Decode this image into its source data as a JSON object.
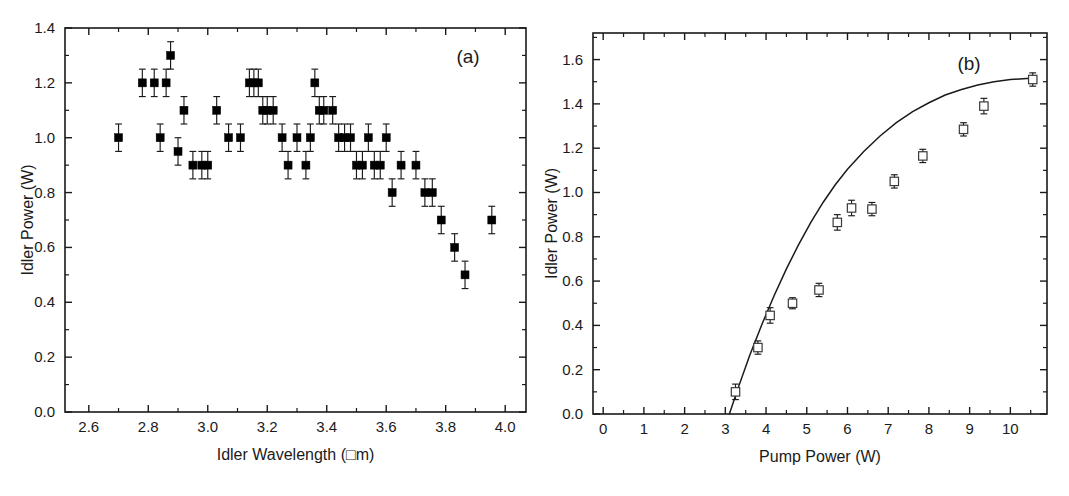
{
  "figure": {
    "background": "#ffffff",
    "foreground": "#1a1a1a"
  },
  "chart_data": [
    {
      "type": "scatter",
      "panel_tag": "(a)",
      "title": "",
      "xlabel": "Idler Wavelength (□m)",
      "ylabel": "Idler Power (W)",
      "xlim": [
        2.52,
        4.07
      ],
      "ylim": [
        0.0,
        1.4
      ],
      "xticks": [
        2.6,
        2.8,
        3.0,
        3.2,
        3.4,
        3.6,
        3.8,
        4.0
      ],
      "xticklabels": [
        "2.6",
        "2.8",
        "3.0",
        "3.2",
        "3.4",
        "3.6",
        "3.8",
        "4.0"
      ],
      "yticks": [
        0.0,
        0.2,
        0.4,
        0.6,
        0.8,
        1.0,
        1.2,
        1.4
      ],
      "yticklabels": [
        "0.0",
        "0.2",
        "0.4",
        "0.6",
        "0.8",
        "1.0",
        "1.2",
        "1.4"
      ],
      "x_minor_tick_interval": 0.1,
      "y_minor_tick_interval": 0.1,
      "grid": false,
      "legend": "none",
      "marker": "filled-square",
      "errorbars": true,
      "x": [
        2.7,
        2.78,
        2.82,
        2.84,
        2.86,
        2.875,
        2.9,
        2.92,
        2.95,
        2.98,
        3.0,
        3.03,
        3.07,
        3.11,
        3.14,
        3.155,
        3.17,
        3.185,
        3.2,
        3.22,
        3.25,
        3.27,
        3.3,
        3.33,
        3.345,
        3.36,
        3.375,
        3.39,
        3.42,
        3.44,
        3.46,
        3.48,
        3.5,
        3.52,
        3.54,
        3.56,
        3.58,
        3.6,
        3.62,
        3.65,
        3.7,
        3.73,
        3.755,
        3.785,
        3.83,
        3.865,
        3.955
      ],
      "y": [
        1.0,
        1.2,
        1.2,
        1.0,
        1.2,
        1.3,
        0.95,
        1.1,
        0.9,
        0.9,
        0.9,
        1.1,
        1.0,
        1.0,
        1.2,
        1.2,
        1.2,
        1.1,
        1.1,
        1.1,
        1.0,
        0.9,
        1.0,
        0.9,
        1.0,
        1.2,
        1.1,
        1.1,
        1.1,
        1.0,
        1.0,
        1.0,
        0.9,
        0.9,
        1.0,
        0.9,
        0.9,
        1.0,
        0.8,
        0.9,
        0.9,
        0.8,
        0.8,
        0.7,
        0.6,
        0.5,
        0.7
      ],
      "yerr": [
        0.05,
        0.05,
        0.05,
        0.05,
        0.05,
        0.05,
        0.05,
        0.05,
        0.05,
        0.05,
        0.05,
        0.05,
        0.05,
        0.05,
        0.05,
        0.05,
        0.05,
        0.05,
        0.05,
        0.05,
        0.05,
        0.05,
        0.05,
        0.05,
        0.05,
        0.05,
        0.05,
        0.05,
        0.05,
        0.05,
        0.05,
        0.05,
        0.05,
        0.05,
        0.05,
        0.05,
        0.05,
        0.05,
        0.05,
        0.05,
        0.05,
        0.05,
        0.05,
        0.05,
        0.05,
        0.05,
        0.05
      ]
    },
    {
      "type": "scatter",
      "panel_tag": "(b)",
      "title": "",
      "xlabel": "Pump Power (W)",
      "ylabel": "Idler Power (W)",
      "xlim": [
        -0.25,
        10.9
      ],
      "ylim": [
        0.0,
        1.72
      ],
      "xticks": [
        0,
        1,
        2,
        3,
        4,
        5,
        6,
        7,
        8,
        9,
        10
      ],
      "xticklabels": [
        "0",
        "1",
        "2",
        "3",
        "4",
        "5",
        "6",
        "7",
        "8",
        "9",
        "10"
      ],
      "yticks": [
        0.0,
        0.2,
        0.4,
        0.6,
        0.8,
        1.0,
        1.2,
        1.4,
        1.6
      ],
      "yticklabels": [
        "0.0",
        "0.2",
        "0.4",
        "0.6",
        "0.8",
        "1.0",
        "1.2",
        "1.4",
        "1.6"
      ],
      "x_minor_tick_interval": 0.5,
      "y_minor_tick_interval": 0.1,
      "grid": false,
      "legend": "none",
      "marker": "open-square",
      "errorbars": true,
      "x": [
        3.25,
        3.8,
        4.1,
        4.65,
        5.3,
        5.75,
        6.1,
        6.6,
        7.15,
        7.85,
        8.85,
        9.35,
        10.55
      ],
      "y": [
        0.1,
        0.3,
        0.445,
        0.5,
        0.56,
        0.865,
        0.93,
        0.925,
        1.05,
        1.165,
        1.285,
        1.39,
        1.51
      ],
      "yerr": [
        0.035,
        0.03,
        0.035,
        0.025,
        0.03,
        0.035,
        0.035,
        0.03,
        0.03,
        0.03,
        0.03,
        0.035,
        0.03
      ],
      "fit_curve": {
        "label": "fit",
        "threshold": 3.1,
        "x": [
          3.1,
          3.3,
          3.6,
          3.9,
          4.2,
          4.5,
          4.8,
          5.1,
          5.4,
          5.7,
          6.0,
          6.4,
          6.8,
          7.2,
          7.6,
          8.0,
          8.4,
          8.8,
          9.2,
          9.6,
          10.0,
          10.4,
          10.6
        ],
        "y": [
          0.0,
          0.11,
          0.265,
          0.405,
          0.535,
          0.655,
          0.765,
          0.865,
          0.955,
          1.035,
          1.105,
          1.185,
          1.255,
          1.315,
          1.365,
          1.405,
          1.44,
          1.465,
          1.485,
          1.5,
          1.51,
          1.515,
          1.515
        ]
      }
    }
  ]
}
